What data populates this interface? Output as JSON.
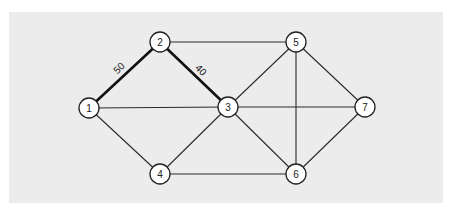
{
  "diagram": {
    "type": "weighted-graph",
    "background_color": "#ececec",
    "nodes": [
      {
        "id": "1",
        "label": "1",
        "x": 89,
        "y": 108
      },
      {
        "id": "2",
        "label": "2",
        "x": 160,
        "y": 42
      },
      {
        "id": "3",
        "label": "3",
        "x": 228,
        "y": 107
      },
      {
        "id": "4",
        "label": "4",
        "x": 160,
        "y": 174
      },
      {
        "id": "5",
        "label": "5",
        "x": 296,
        "y": 42
      },
      {
        "id": "6",
        "label": "6",
        "x": 296,
        "y": 174
      },
      {
        "id": "7",
        "label": "7",
        "x": 365,
        "y": 107
      }
    ],
    "edges": [
      {
        "from": "1",
        "to": "2",
        "weight": "50",
        "highlighted": true
      },
      {
        "from": "2",
        "to": "3",
        "weight": "40",
        "highlighted": true
      },
      {
        "from": "1",
        "to": "3",
        "weight": null,
        "highlighted": false
      },
      {
        "from": "1",
        "to": "4",
        "weight": null,
        "highlighted": false
      },
      {
        "from": "2",
        "to": "5",
        "weight": null,
        "highlighted": false
      },
      {
        "from": "3",
        "to": "4",
        "weight": null,
        "highlighted": false
      },
      {
        "from": "3",
        "to": "5",
        "weight": null,
        "highlighted": false
      },
      {
        "from": "3",
        "to": "6",
        "weight": null,
        "highlighted": false
      },
      {
        "from": "3",
        "to": "7",
        "weight": null,
        "highlighted": false
      },
      {
        "from": "4",
        "to": "6",
        "weight": null,
        "highlighted": false
      },
      {
        "from": "5",
        "to": "6",
        "weight": null,
        "highlighted": false
      },
      {
        "from": "5",
        "to": "7",
        "weight": null,
        "highlighted": false
      },
      {
        "from": "6",
        "to": "7",
        "weight": null,
        "highlighted": false
      }
    ],
    "edge_labels": [
      {
        "edge": "1-2",
        "text": "50",
        "x": 119,
        "y": 68,
        "rotate": -45
      },
      {
        "edge": "2-3",
        "text": "40",
        "x": 201,
        "y": 70,
        "rotate": 45
      }
    ]
  }
}
